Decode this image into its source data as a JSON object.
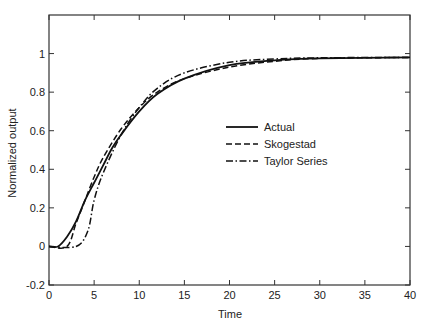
{
  "chart_data": {
    "type": "line",
    "title": "",
    "xlabel": "Time",
    "ylabel": "Normalized output",
    "xlim": [
      0,
      40
    ],
    "ylim": [
      -0.2,
      1.2
    ],
    "xticks": [
      0,
      5,
      10,
      15,
      20,
      25,
      30,
      35,
      40
    ],
    "xtick_labels": [
      "0",
      "5",
      "10",
      "15",
      "20",
      "25",
      "30",
      "35",
      "40"
    ],
    "yticks": [
      -0.2,
      0,
      0.2,
      0.4,
      0.6,
      0.8,
      1
    ],
    "ytick_labels": [
      "-0.2",
      "0",
      "0.2",
      "0.4",
      "0.6",
      "0.8",
      "1"
    ],
    "grid": false,
    "legend_position": "center-right",
    "series": [
      {
        "name": "Actual",
        "style": "solid",
        "x": [
          0,
          1,
          2,
          3,
          4,
          5,
          6,
          7,
          8,
          10,
          12,
          15,
          20,
          25,
          30,
          40
        ],
        "y": [
          0,
          0,
          0.05,
          0.13,
          0.24,
          0.33,
          0.42,
          0.51,
          0.58,
          0.7,
          0.79,
          0.87,
          0.94,
          0.965,
          0.975,
          0.98
        ]
      },
      {
        "name": "Skogestad",
        "style": "dashed",
        "x": [
          0,
          2,
          3,
          4,
          5,
          6,
          8,
          10,
          12,
          15,
          20,
          25,
          30,
          40
        ],
        "y": [
          0,
          0,
          0.12,
          0.24,
          0.36,
          0.46,
          0.61,
          0.72,
          0.8,
          0.87,
          0.93,
          0.96,
          0.975,
          0.98
        ]
      },
      {
        "name": "Taylor Series",
        "style": "dashdot",
        "x": [
          0,
          3,
          4.3,
          5,
          6,
          8,
          10,
          12,
          15,
          20,
          25,
          30,
          40
        ],
        "y": [
          0,
          0,
          0.08,
          0.24,
          0.38,
          0.58,
          0.72,
          0.82,
          0.9,
          0.955,
          0.972,
          0.978,
          0.98
        ]
      }
    ]
  },
  "colors": {
    "line": "#111111",
    "axis": "#333333",
    "background": "#ffffff"
  }
}
